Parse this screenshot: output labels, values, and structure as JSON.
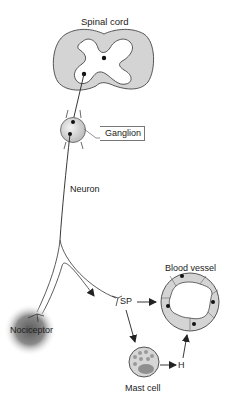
{
  "diagram": {
    "type": "neurogenic inflammation pathway",
    "labels": {
      "spinal_cord": "Spinal cord",
      "ganglion": "Ganglion",
      "neuron": "Neuron",
      "nociceptor": "Nociceptor",
      "sp": "SP",
      "blood_vessel": "Blood vessel",
      "mast_cell": "Mast cell",
      "h": "H"
    },
    "nodes": [
      {
        "id": "spinal_cord",
        "label": "Spinal cord"
      },
      {
        "id": "ganglion",
        "label": "Ganglion"
      },
      {
        "id": "neuron",
        "label": "Neuron"
      },
      {
        "id": "nociceptor",
        "label": "Nociceptor"
      },
      {
        "id": "sp",
        "label": "SP"
      },
      {
        "id": "blood_vessel",
        "label": "Blood vessel"
      },
      {
        "id": "mast_cell",
        "label": "Mast cell"
      },
      {
        "id": "h",
        "label": "H"
      }
    ],
    "edges": [
      {
        "from": "nociceptor",
        "to": "ganglion",
        "via": "neuron"
      },
      {
        "from": "ganglion",
        "to": "spinal_cord"
      },
      {
        "from": "neuron",
        "to": "sp",
        "kind": "arrow"
      },
      {
        "from": "sp",
        "to": "blood_vessel",
        "kind": "arrow"
      },
      {
        "from": "sp",
        "to": "mast_cell",
        "kind": "arrow"
      },
      {
        "from": "mast_cell",
        "to": "h",
        "kind": "arrow"
      },
      {
        "from": "h",
        "to": "blood_vessel",
        "kind": "arrow"
      }
    ],
    "colors": {
      "tissue_gray": "#d4d4d4",
      "outline": "#333333",
      "nociceptor_dark": "#6e6e6e",
      "mast_granule": "#9a9a9a"
    }
  }
}
